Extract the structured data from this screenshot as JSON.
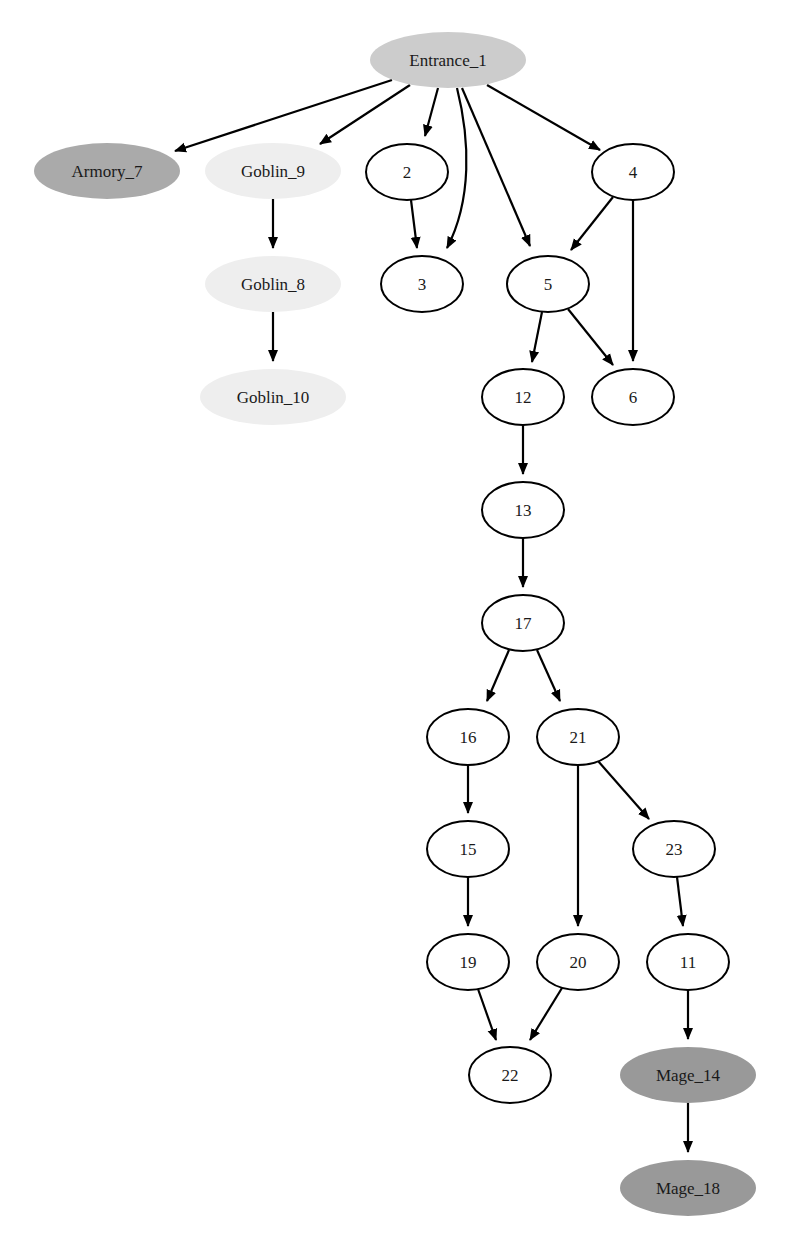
{
  "diagram": {
    "type": "directed-graph",
    "colors": {
      "entrance_fill": "#cccccc",
      "armory_fill": "#aaaaaa",
      "goblin_fill": "#eeeeee",
      "mage_fill": "#999999",
      "default_fill": "#ffffff",
      "outline": "#000000"
    },
    "nodes": [
      {
        "id": "Entrance_1",
        "label": "Entrance_1",
        "cx": 448,
        "cy": 60,
        "rx": 78,
        "ry": 28,
        "fill": "#cccccc",
        "stroke": false
      },
      {
        "id": "Armory_7",
        "label": "Armory_7",
        "cx": 107,
        "cy": 171,
        "rx": 73,
        "ry": 28,
        "fill": "#aaaaaa",
        "stroke": false
      },
      {
        "id": "Goblin_9",
        "label": "Goblin_9",
        "cx": 273,
        "cy": 171,
        "rx": 68,
        "ry": 28,
        "fill": "#eeeeee",
        "stroke": false
      },
      {
        "id": "Goblin_8",
        "label": "Goblin_8",
        "cx": 273,
        "cy": 284,
        "rx": 68,
        "ry": 28,
        "fill": "#eeeeee",
        "stroke": false
      },
      {
        "id": "Goblin_10",
        "label": "Goblin_10",
        "cx": 273,
        "cy": 397,
        "rx": 73,
        "ry": 28,
        "fill": "#eeeeee",
        "stroke": false
      },
      {
        "id": "2",
        "label": "2",
        "cx": 407,
        "cy": 172,
        "rx": 41,
        "ry": 28,
        "fill": "#ffffff",
        "stroke": true
      },
      {
        "id": "3",
        "label": "3",
        "cx": 422,
        "cy": 284,
        "rx": 41,
        "ry": 28,
        "fill": "#ffffff",
        "stroke": true
      },
      {
        "id": "4",
        "label": "4",
        "cx": 633,
        "cy": 172,
        "rx": 41,
        "ry": 28,
        "fill": "#ffffff",
        "stroke": true
      },
      {
        "id": "5",
        "label": "5",
        "cx": 548,
        "cy": 284,
        "rx": 41,
        "ry": 28,
        "fill": "#ffffff",
        "stroke": true
      },
      {
        "id": "12",
        "label": "12",
        "cx": 523,
        "cy": 397,
        "rx": 41,
        "ry": 28,
        "fill": "#ffffff",
        "stroke": true
      },
      {
        "id": "6",
        "label": "6",
        "cx": 633,
        "cy": 397,
        "rx": 41,
        "ry": 28,
        "fill": "#ffffff",
        "stroke": true
      },
      {
        "id": "13",
        "label": "13",
        "cx": 523,
        "cy": 510,
        "rx": 41,
        "ry": 28,
        "fill": "#ffffff",
        "stroke": true
      },
      {
        "id": "17",
        "label": "17",
        "cx": 523,
        "cy": 623,
        "rx": 41,
        "ry": 28,
        "fill": "#ffffff",
        "stroke": true
      },
      {
        "id": "16",
        "label": "16",
        "cx": 468,
        "cy": 737,
        "rx": 41,
        "ry": 28,
        "fill": "#ffffff",
        "stroke": true
      },
      {
        "id": "21",
        "label": "21",
        "cx": 578,
        "cy": 737,
        "rx": 41,
        "ry": 28,
        "fill": "#ffffff",
        "stroke": true
      },
      {
        "id": "15",
        "label": "15",
        "cx": 468,
        "cy": 849,
        "rx": 41,
        "ry": 28,
        "fill": "#ffffff",
        "stroke": true
      },
      {
        "id": "23",
        "label": "23",
        "cx": 674,
        "cy": 849,
        "rx": 41,
        "ry": 28,
        "fill": "#ffffff",
        "stroke": true
      },
      {
        "id": "19",
        "label": "19",
        "cx": 468,
        "cy": 962,
        "rx": 41,
        "ry": 28,
        "fill": "#ffffff",
        "stroke": true
      },
      {
        "id": "20",
        "label": "20",
        "cx": 578,
        "cy": 962,
        "rx": 41,
        "ry": 28,
        "fill": "#ffffff",
        "stroke": true
      },
      {
        "id": "11",
        "label": "11",
        "cx": 688,
        "cy": 962,
        "rx": 41,
        "ry": 28,
        "fill": "#ffffff",
        "stroke": true
      },
      {
        "id": "22",
        "label": "22",
        "cx": 510,
        "cy": 1075,
        "rx": 41,
        "ry": 28,
        "fill": "#ffffff",
        "stroke": true
      },
      {
        "id": "Mage_14",
        "label": "Mage_14",
        "cx": 688,
        "cy": 1075,
        "rx": 68,
        "ry": 28,
        "fill": "#999999",
        "stroke": false
      },
      {
        "id": "Mage_18",
        "label": "Mage_18",
        "cx": 688,
        "cy": 1188,
        "rx": 68,
        "ry": 28,
        "fill": "#999999",
        "stroke": false
      }
    ],
    "edges": [
      {
        "from": "Entrance_1",
        "to": "Armory_7",
        "path": "M392,80 L175,151"
      },
      {
        "from": "Entrance_1",
        "to": "Goblin_9",
        "path": "M410,85 L320,144"
      },
      {
        "from": "Entrance_1",
        "to": "2",
        "path": "M438,88 L425,136"
      },
      {
        "from": "Entrance_1",
        "to": "3",
        "path": "M457,88 C470,140 472,200 447,248"
      },
      {
        "from": "Entrance_1",
        "to": "5",
        "path": "M462,88 L530,246"
      },
      {
        "from": "Entrance_1",
        "to": "4",
        "path": "M487,85 L600,150"
      },
      {
        "from": "2",
        "to": "3",
        "path": "M411,200 L417,248"
      },
      {
        "from": "4",
        "to": "5",
        "path": "M613,197 L571,250"
      },
      {
        "from": "4",
        "to": "6",
        "path": "M633,200 L633,361"
      },
      {
        "from": "5",
        "to": "12",
        "path": "M542,312 L532,362"
      },
      {
        "from": "5",
        "to": "6",
        "path": "M568,309 L613,365"
      },
      {
        "from": "Goblin_9",
        "to": "Goblin_8",
        "path": "M273,199 L273,248"
      },
      {
        "from": "Goblin_8",
        "to": "Goblin_10",
        "path": "M273,312 L273,361"
      },
      {
        "from": "12",
        "to": "13",
        "path": "M523,425 L523,474"
      },
      {
        "from": "13",
        "to": "17",
        "path": "M523,538 L523,587"
      },
      {
        "from": "17",
        "to": "16",
        "path": "M509,650 L487,701"
      },
      {
        "from": "17",
        "to": "21",
        "path": "M537,650 L560,701"
      },
      {
        "from": "16",
        "to": "15",
        "path": "M468,765 L468,813"
      },
      {
        "from": "21",
        "to": "20",
        "path": "M578,765 L578,926"
      },
      {
        "from": "21",
        "to": "23",
        "path": "M598,761 L649,819"
      },
      {
        "from": "15",
        "to": "19",
        "path": "M468,877 L468,926"
      },
      {
        "from": "23",
        "to": "11",
        "path": "M677,877 L683,926"
      },
      {
        "from": "19",
        "to": "22",
        "path": "M478,989 L496,1040"
      },
      {
        "from": "20",
        "to": "22",
        "path": "M562,988 L530,1040"
      },
      {
        "from": "11",
        "to": "Mage_14",
        "path": "M688,990 L688,1039"
      },
      {
        "from": "Mage_14",
        "to": "Mage_18",
        "path": "M688,1103 L688,1152"
      }
    ]
  }
}
